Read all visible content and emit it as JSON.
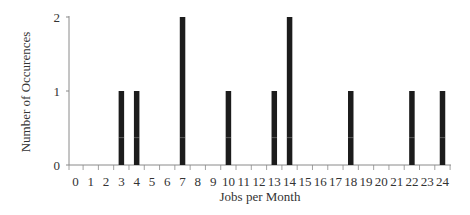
{
  "chart_data": {
    "type": "bar",
    "title": "",
    "xlabel": "Jobs per Month",
    "ylabel": "Number of Occurences",
    "x": [
      3,
      4,
      7,
      10,
      13,
      14,
      18,
      22,
      24
    ],
    "values": [
      1,
      1,
      2,
      1,
      1,
      2,
      1,
      1,
      1
    ],
    "x_ticks": [
      0,
      1,
      2,
      3,
      4,
      5,
      6,
      7,
      8,
      9,
      10,
      11,
      12,
      13,
      14,
      15,
      16,
      17,
      18,
      19,
      20,
      21,
      22,
      23,
      24
    ],
    "y_ticks": [
      0,
      1,
      2
    ],
    "xlim": [
      0,
      24
    ],
    "ylim": [
      0,
      2
    ],
    "grid": false,
    "legend": "none",
    "colors": {
      "bar": "#1c1c1c",
      "axis": "#8a8a8a",
      "text": "#333333",
      "bar_stripe": "#e8e8e8"
    }
  }
}
